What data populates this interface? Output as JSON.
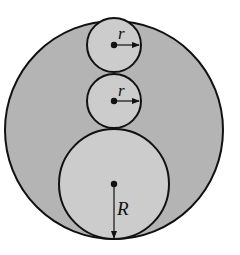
{
  "diagram": {
    "colors": {
      "background": "#ffffff",
      "outer_fill": "#b4b4b4",
      "inner_fill": "#cccccc",
      "stroke": "#111111"
    },
    "outer_circle": {
      "cx": 114,
      "cy": 130,
      "r": 109
    },
    "small_circles": [
      {
        "cx": 114,
        "cy": 45,
        "r": 27,
        "label": "r"
      },
      {
        "cx": 114,
        "cy": 101,
        "r": 27,
        "label": "r"
      }
    ],
    "large_circle": {
      "cx": 114,
      "cy": 184,
      "r": 55,
      "label": "R"
    }
  }
}
